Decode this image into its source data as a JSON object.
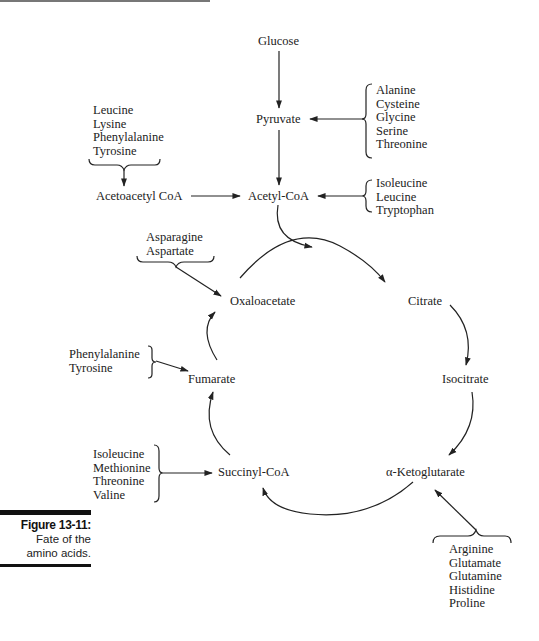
{
  "figure": {
    "label": "Figure 13-11:",
    "caption_lines": [
      "Fate of the",
      "amino acids."
    ]
  },
  "nodes": {
    "glucose": "Glucose",
    "pyruvate": "Pyruvate",
    "acetyl_coa": "Acetyl-CoA",
    "acetoacetyl_coa": "Acetoacetyl CoA",
    "oxaloacetate": "Oxaloacetate",
    "citrate": "Citrate",
    "fumarate": "Fumarate",
    "isocitrate": "Isocitrate",
    "succinyl_coa": "Succinyl-CoA",
    "alpha_ketoglutarate": "α-Ketoglutarate"
  },
  "groups": {
    "to_pyruvate": [
      "Alanine",
      "Cysteine",
      "Glycine",
      "Serine",
      "Threonine"
    ],
    "to_acetoacetyl": [
      "Leucine",
      "Lysine",
      "Phenylalanine",
      "Tyrosine"
    ],
    "to_acetyl_coa": [
      "Isoleucine",
      "Leucine",
      "Tryptophan"
    ],
    "to_oxaloacetate": [
      "Asparagine",
      "Aspartate"
    ],
    "to_fumarate": [
      "Phenylalanine",
      "Tyrosine"
    ],
    "to_succinyl_coa": [
      "Isoleucine",
      "Methionine",
      "Threonine",
      "Valine"
    ],
    "to_alpha_ketoglutarate": [
      "Arginine",
      "Glutamate",
      "Glutamine",
      "Histidine",
      "Proline"
    ]
  }
}
